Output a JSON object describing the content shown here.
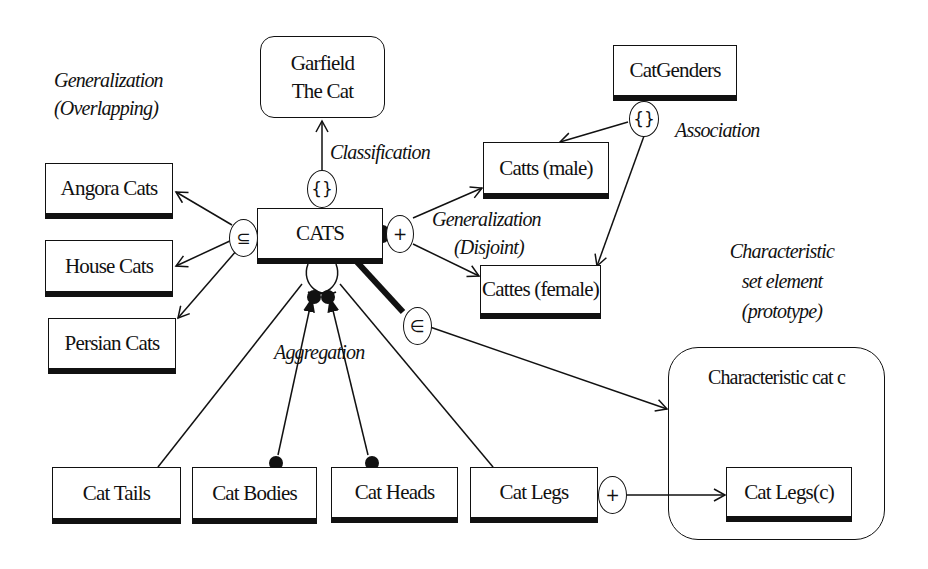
{
  "diagram": {
    "type": "semantic data model (set-based) diagram",
    "entities": {
      "garfield": {
        "label_line1": "Garfield",
        "label_line2": "The Cat",
        "shape": "rounded-rect (instance)"
      },
      "catgenders": {
        "label": "CatGenders"
      },
      "angora": {
        "label": "Angora Cats"
      },
      "house": {
        "label": "House Cats"
      },
      "persian": {
        "label": "Persian Cats"
      },
      "cats": {
        "label": "CATS"
      },
      "catts_male": {
        "label": "Catts (male)"
      },
      "cattes_female": {
        "label": "Cattes (female)"
      },
      "cat_tails": {
        "label": "Cat Tails"
      },
      "cat_bodies": {
        "label": "Cat Bodies"
      },
      "cat_heads": {
        "label": "Cat Heads"
      },
      "cat_legs": {
        "label": "Cat Legs"
      },
      "characteristic_cat": {
        "label": "Characteristic cat c",
        "shape": "rounded container"
      },
      "cat_legs_c": {
        "label": "Cat Legs(c)"
      }
    },
    "annotations": {
      "generalization_overlapping": {
        "line1": "Generalization",
        "line2": "(Overlapping)"
      },
      "classification": "Classification",
      "association": "Association",
      "generalization_disjoint": {
        "line1": "Generalization",
        "line2": "(Disjoint)"
      },
      "aggregation": "Aggregation",
      "characteristic_set_element": {
        "line1": "Characteristic",
        "line2": "set element",
        "line3": "(prototype)"
      }
    },
    "connector_symbols": {
      "classification": "{}",
      "association": "{}",
      "overlapping_generalization": "⊆",
      "disjoint_generalization": "+",
      "membership": "∈",
      "legs_mapping": "+"
    },
    "relationships": [
      {
        "from": "CATS",
        "to": "Garfield The Cat",
        "via": "{}",
        "kind": "Classification"
      },
      {
        "from": "CatGenders",
        "to": "Catts (male)",
        "via": "{}",
        "kind": "Association"
      },
      {
        "from": "CatGenders",
        "to": "Cattes (female)",
        "via": "{}",
        "kind": "Association"
      },
      {
        "from": "CATS",
        "to": "Angora Cats",
        "via": "⊆",
        "kind": "Generalization (Overlapping)"
      },
      {
        "from": "CATS",
        "to": "House Cats",
        "via": "⊆",
        "kind": "Generalization (Overlapping)"
      },
      {
        "from": "CATS",
        "to": "Persian Cats",
        "via": "⊆",
        "kind": "Generalization (Overlapping)"
      },
      {
        "from": "CATS",
        "to": "Catts (male)",
        "via": "+",
        "kind": "Generalization (Disjoint)"
      },
      {
        "from": "CATS",
        "to": "Cattes (female)",
        "via": "+",
        "kind": "Generalization (Disjoint)"
      },
      {
        "from": "CATS",
        "to": "Cat Tails",
        "kind": "Aggregation"
      },
      {
        "from": "CATS",
        "to": "Cat Bodies",
        "kind": "Aggregation"
      },
      {
        "from": "CATS",
        "to": "Cat Heads",
        "kind": "Aggregation"
      },
      {
        "from": "CATS",
        "to": "Cat Legs",
        "kind": "Aggregation"
      },
      {
        "from": "CATS",
        "to": "Characteristic cat c",
        "via": "∈",
        "kind": "Characteristic set element"
      },
      {
        "from": "Cat Legs",
        "to": "Cat Legs(c)",
        "via": "+"
      }
    ],
    "colors": {
      "ink": "#111111",
      "background": "#ffffff"
    }
  }
}
